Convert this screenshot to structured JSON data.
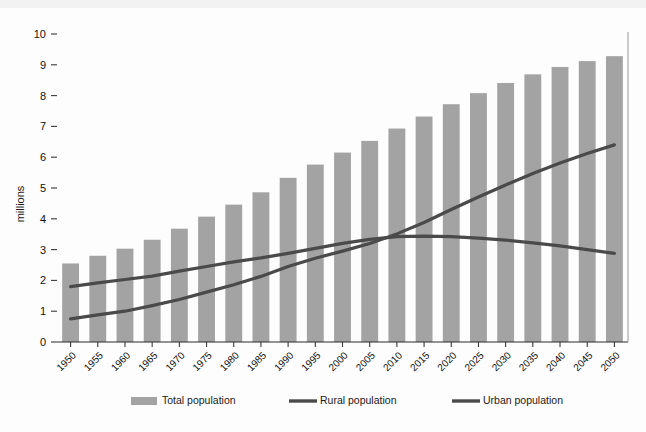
{
  "chart_data": {
    "type": "bar",
    "title": "",
    "xlabel": "",
    "ylabel": "millions",
    "ylim": [
      0,
      10
    ],
    "ytick_values": [
      0,
      1,
      2,
      3,
      4,
      5,
      6,
      7,
      8,
      9,
      10
    ],
    "ytick_labels": [
      "0",
      "1",
      "2",
      "3",
      "4",
      "5",
      "6",
      "7",
      "8",
      "9",
      "10"
    ],
    "grid": false,
    "legend_position": "bottom",
    "categories": [
      "1950",
      "1955",
      "1960",
      "1965",
      "1970",
      "1975",
      "1980",
      "1985",
      "1990",
      "1995",
      "2000",
      "2005",
      "2010",
      "2015",
      "2020",
      "2025",
      "2030",
      "2035",
      "2040",
      "2045",
      "2050"
    ],
    "series": [
      {
        "name": "Total population",
        "type": "bar",
        "color": "#a3a3a3",
        "values": [
          2.55,
          2.8,
          3.03,
          3.32,
          3.68,
          4.07,
          4.46,
          4.86,
          5.33,
          5.76,
          6.15,
          6.53,
          6.93,
          7.32,
          7.72,
          8.08,
          8.41,
          8.69,
          8.93,
          9.12,
          9.28
        ]
      },
      {
        "name": "Rural population",
        "type": "line",
        "color": "#4a4a4a",
        "values": [
          1.8,
          1.92,
          2.03,
          2.14,
          2.3,
          2.45,
          2.6,
          2.73,
          2.88,
          3.04,
          3.2,
          3.33,
          3.42,
          3.44,
          3.42,
          3.37,
          3.31,
          3.22,
          3.12,
          3.0,
          2.88
        ]
      },
      {
        "name": "Urban population",
        "type": "line",
        "color": "#4a4a4a",
        "values": [
          0.75,
          0.88,
          1.0,
          1.18,
          1.38,
          1.62,
          1.86,
          2.13,
          2.45,
          2.72,
          2.95,
          3.2,
          3.51,
          3.88,
          4.3,
          4.71,
          5.1,
          5.47,
          5.81,
          6.12,
          6.4
        ]
      }
    ],
    "annotations": [],
    "legend": [
      {
        "label": "Total population",
        "marker": "bar-swatch",
        "color": "#a3a3a3"
      },
      {
        "label": "Rural population",
        "marker": "line-swatch",
        "color": "#4a4a4a"
      },
      {
        "label": "Urban population",
        "marker": "line-swatch",
        "color": "#4a4a4a"
      }
    ]
  }
}
